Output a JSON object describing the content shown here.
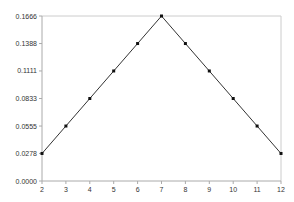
{
  "chart_data": {
    "type": "line",
    "title": "",
    "xlabel": "",
    "ylabel": "",
    "x": [
      2,
      3,
      4,
      5,
      6,
      7,
      8,
      9,
      10,
      11,
      12
    ],
    "categories": [
      "2",
      "3",
      "4",
      "5",
      "6",
      "7",
      "8",
      "9",
      "10",
      "11",
      "12"
    ],
    "series": [
      {
        "name": "Probability",
        "values": [
          0.0278,
          0.0555,
          0.0833,
          0.1111,
          0.1388,
          0.1666,
          0.1388,
          0.1111,
          0.0833,
          0.0555,
          0.0278
        ],
        "color": "#333333",
        "marker": "square"
      }
    ],
    "yticks": [
      "0.0000",
      "0.0278",
      "0.0555",
      "0.0833",
      "0.1111",
      "0.1388",
      "0.1666"
    ],
    "ytick_values": [
      0.0,
      0.0278,
      0.0555,
      0.0833,
      0.1111,
      0.1388,
      0.1666
    ],
    "xticks": [
      "2",
      "3",
      "4",
      "5",
      "6",
      "7",
      "8",
      "9",
      "10",
      "11",
      "12"
    ],
    "ylim": [
      0.0,
      0.1666
    ],
    "xlim": [
      2,
      12
    ],
    "grid": false,
    "legend": "none"
  },
  "colors": {
    "line": "#333333",
    "marker": "#111111",
    "axis": "#aaaaaa",
    "frame": "#cccccc"
  }
}
